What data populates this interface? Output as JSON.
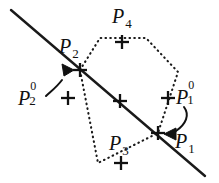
{
  "figure": {
    "caption_present": false,
    "background_color": "#ffffff",
    "ink_color": "#111111",
    "width": 219,
    "height": 183
  },
  "labels": {
    "p2": {
      "base": "P",
      "sub": "2",
      "sup": ""
    },
    "p4": {
      "base": "P",
      "sub": "4",
      "sup": ""
    },
    "p3": {
      "base": "P",
      "sub": "3",
      "sup": ""
    },
    "p1": {
      "base": "P",
      "sub": "1",
      "sup": ""
    },
    "p2_0": {
      "base": "P",
      "sub": "2",
      "sup": "0"
    },
    "p1_0": {
      "base": "P",
      "sub": "1",
      "sup": "0"
    }
  },
  "geometry": {
    "line_type": "solid-straight-line",
    "line": {
      "x1": 11,
      "y1": 10,
      "x2": 205,
      "y2": 176
    },
    "polygon_type": "dotted-hexagon",
    "polygon_points": "80,70 100,38 146,38 178,72 158,133 98,163",
    "markers": [
      {
        "name": "marker-p2-vertex",
        "x": 80,
        "y": 70
      },
      {
        "name": "marker-p4-top",
        "x": 122,
        "y": 42
      },
      {
        "name": "marker-p2-zero",
        "x": 68,
        "y": 98
      },
      {
        "name": "marker-center",
        "x": 120,
        "y": 101
      },
      {
        "name": "marker-p1-zero",
        "x": 168,
        "y": 98
      },
      {
        "name": "marker-p1-vertex",
        "x": 158,
        "y": 133
      },
      {
        "name": "marker-p3-bottom",
        "x": 121,
        "y": 163
      }
    ],
    "arrows": [
      {
        "name": "arrow-p2-zero-to-p2",
        "tip_x": 67,
        "tip_y": 68,
        "direction": "up-left"
      },
      {
        "name": "arrow-p1-zero-to-p1",
        "tip_x": 170,
        "tip_y": 134,
        "direction": "right-down"
      }
    ]
  }
}
